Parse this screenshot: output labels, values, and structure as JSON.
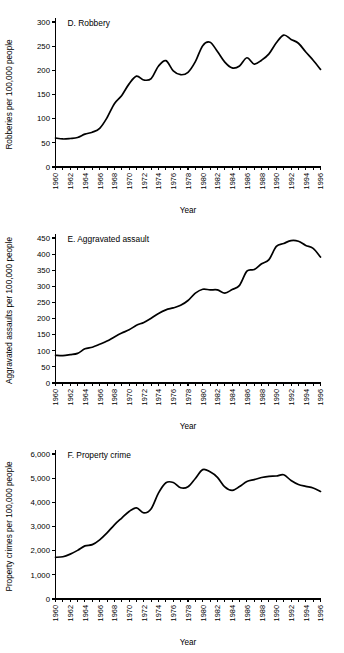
{
  "figure": {
    "background": "#ffffff",
    "line_color": "#000000",
    "panel_count": 3
  },
  "chart_data": [
    {
      "type": "line",
      "title": "D. Robbery",
      "xlabel": "Year",
      "ylabel": "Robberies per 100,000 people",
      "ylim": [
        0,
        300
      ],
      "yticks": [
        0,
        50,
        100,
        150,
        200,
        250,
        300
      ],
      "ytick_labels": [
        "0",
        "50",
        "100",
        "150",
        "200",
        "250",
        "300"
      ],
      "xlim": [
        1960,
        1996
      ],
      "xticks": [
        1960,
        1961,
        1962,
        1963,
        1964,
        1965,
        1966,
        1967,
        1968,
        1969,
        1970,
        1971,
        1972,
        1973,
        1974,
        1975,
        1976,
        1977,
        1978,
        1979,
        1980,
        1981,
        1982,
        1983,
        1984,
        1985,
        1986,
        1987,
        1988,
        1989,
        1990,
        1991,
        1992,
        1993,
        1994,
        1995,
        1996
      ],
      "xtick_labels": [
        "1960",
        "",
        "1962",
        "",
        "1964",
        "",
        "1966",
        "",
        "1968",
        "",
        "1970",
        "",
        "1972",
        "",
        "1974",
        "",
        "1976",
        "",
        "1978",
        "",
        "1980",
        "",
        "1982",
        "",
        "1984",
        "",
        "1986",
        "",
        "1988",
        "",
        "1990",
        "",
        "1992",
        "",
        "1994",
        "",
        "1996"
      ],
      "grid": false,
      "legend": false,
      "x": [
        1960,
        1961,
        1962,
        1963,
        1964,
        1965,
        1966,
        1967,
        1968,
        1969,
        1970,
        1971,
        1972,
        1973,
        1974,
        1975,
        1976,
        1977,
        1978,
        1979,
        1980,
        1981,
        1982,
        1983,
        1984,
        1985,
        1986,
        1987,
        1988,
        1989,
        1990,
        1991,
        1992,
        1993,
        1994,
        1995,
        1996
      ],
      "values": [
        60,
        58,
        59,
        61,
        68,
        72,
        80,
        102,
        131,
        148,
        172,
        188,
        180,
        183,
        209,
        220,
        199,
        191,
        196,
        218,
        251,
        258,
        239,
        217,
        205,
        209,
        226,
        213,
        221,
        234,
        257,
        273,
        264,
        256,
        238,
        221,
        202
      ]
    },
    {
      "type": "line",
      "title": "E. Aggravated assault",
      "xlabel": "Year",
      "ylabel": "Aggravated assaults per 100,000 people",
      "ylim": [
        0,
        450
      ],
      "yticks": [
        0,
        50,
        100,
        150,
        200,
        250,
        300,
        350,
        400,
        450
      ],
      "ytick_labels": [
        "0",
        "50",
        "100",
        "150",
        "200",
        "250",
        "300",
        "350",
        "400",
        "450"
      ],
      "xlim": [
        1960,
        1996
      ],
      "xticks": [
        1960,
        1961,
        1962,
        1963,
        1964,
        1965,
        1966,
        1967,
        1968,
        1969,
        1970,
        1971,
        1972,
        1973,
        1974,
        1975,
        1976,
        1977,
        1978,
        1979,
        1980,
        1981,
        1982,
        1983,
        1984,
        1985,
        1986,
        1987,
        1988,
        1989,
        1990,
        1991,
        1992,
        1993,
        1994,
        1995,
        1996
      ],
      "xtick_labels": [
        "1960",
        "",
        "1962",
        "",
        "1964",
        "",
        "1966",
        "",
        "1968",
        "",
        "1970",
        "",
        "1972",
        "",
        "1974",
        "",
        "1976",
        "",
        "1978",
        "",
        "1980",
        "",
        "1982",
        "",
        "1984",
        "",
        "1986",
        "",
        "1988",
        "",
        "1990",
        "",
        "1992",
        "",
        "1994",
        "",
        "1996"
      ],
      "grid": false,
      "legend": false,
      "x": [
        1960,
        1961,
        1962,
        1963,
        1964,
        1965,
        1966,
        1967,
        1968,
        1969,
        1970,
        1971,
        1972,
        1973,
        1974,
        1975,
        1976,
        1977,
        1978,
        1979,
        1980,
        1981,
        1982,
        1983,
        1984,
        1985,
        1986,
        1987,
        1988,
        1989,
        1990,
        1991,
        1992,
        1993,
        1994,
        1995,
        1996
      ],
      "values": [
        86,
        85,
        88,
        92,
        106,
        111,
        120,
        130,
        143,
        155,
        165,
        179,
        188,
        201,
        216,
        227,
        233,
        241,
        256,
        279,
        291,
        289,
        289,
        279,
        290,
        303,
        347,
        352,
        370,
        383,
        424,
        433,
        442,
        440,
        427,
        418,
        391
      ]
    },
    {
      "type": "line",
      "title": "F. Property crime",
      "xlabel": "Year",
      "ylabel": "Property crimes per 100,000 people",
      "ylim": [
        0,
        6000
      ],
      "yticks": [
        0,
        1000,
        2000,
        3000,
        4000,
        5000,
        6000
      ],
      "ytick_labels": [
        "0",
        "1,000",
        "2,000",
        "3,000",
        "4,000",
        "5,000",
        "6,000"
      ],
      "xlim": [
        1960,
        1996
      ],
      "xticks": [
        1960,
        1961,
        1962,
        1963,
        1964,
        1965,
        1966,
        1967,
        1968,
        1969,
        1970,
        1971,
        1972,
        1973,
        1974,
        1975,
        1976,
        1977,
        1978,
        1979,
        1980,
        1981,
        1982,
        1983,
        1984,
        1985,
        1986,
        1987,
        1988,
        1989,
        1990,
        1991,
        1992,
        1993,
        1994,
        1995,
        1996
      ],
      "xtick_labels": [
        "1960",
        "",
        "1962",
        "",
        "1964",
        "",
        "1966",
        "",
        "1968",
        "",
        "1970",
        "",
        "1972",
        "",
        "1974",
        "",
        "1976",
        "",
        "1978",
        "",
        "1980",
        "",
        "1982",
        "",
        "1984",
        "",
        "1986",
        "",
        "1988",
        "",
        "1990",
        "",
        "1992",
        "",
        "1994",
        "",
        "1996"
      ],
      "grid": false,
      "legend": false,
      "x": [
        1960,
        1961,
        1962,
        1963,
        1964,
        1965,
        1966,
        1967,
        1968,
        1969,
        1970,
        1971,
        1972,
        1973,
        1974,
        1975,
        1976,
        1977,
        1978,
        1979,
        1980,
        1981,
        1982,
        1983,
        1984,
        1985,
        1986,
        1987,
        1988,
        1989,
        1990,
        1991,
        1992,
        1993,
        1994,
        1995,
        1996
      ],
      "values": [
        1726,
        1747,
        1857,
        2012,
        2198,
        2249,
        2450,
        2736,
        3071,
        3351,
        3621,
        3769,
        3561,
        3737,
        4390,
        4811,
        4820,
        4602,
        4643,
        4986,
        5353,
        5264,
        5033,
        4637,
        4492,
        4651,
        4863,
        4940,
        5027,
        5078,
        5089,
        5140,
        4903,
        4740,
        4660,
        4593,
        4450
      ]
    }
  ]
}
